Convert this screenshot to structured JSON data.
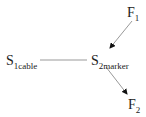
{
  "nodes": {
    "s1": {
      "main": "S",
      "sub": "1cable"
    },
    "s2": {
      "main": "S",
      "sub": "2marker"
    },
    "f1": {
      "main": "F",
      "sub": "1"
    },
    "f2": {
      "main": "F",
      "sub": "2"
    }
  },
  "edges": [
    {
      "from": "s1",
      "to": "s2",
      "type": "line"
    },
    {
      "from": "f1",
      "to": "s2",
      "type": "arrow"
    },
    {
      "from": "s2",
      "to": "f2",
      "type": "arrow"
    }
  ],
  "colors": {
    "line": "#999999",
    "arrowhead": "#111111",
    "text": "#222222"
  }
}
